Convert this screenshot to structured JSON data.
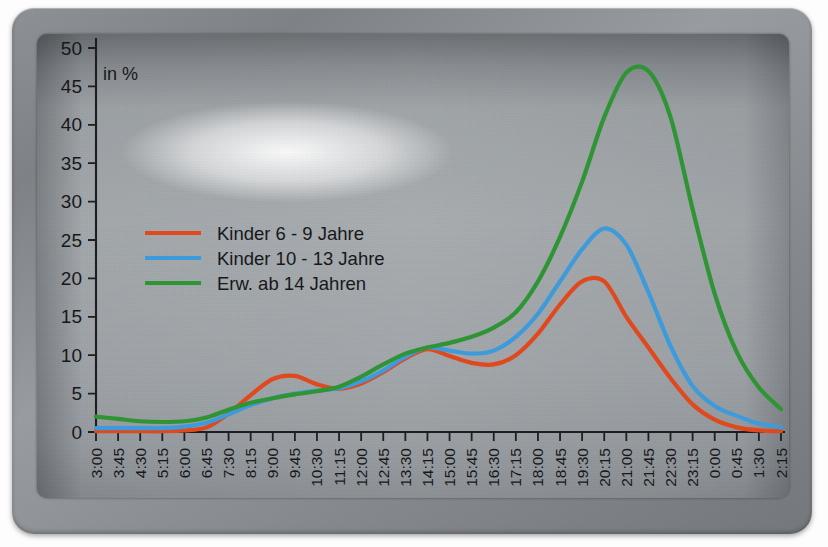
{
  "device": {
    "type": "photographed-display-panel",
    "bezel_color": "#85888c",
    "screen_color": "#cfd2d4"
  },
  "chart_data": {
    "type": "line",
    "title": "",
    "unit_label": "in %",
    "xlabel": "",
    "ylabel": "",
    "ylim": [
      0,
      50
    ],
    "yticks": [
      0,
      5,
      10,
      15,
      20,
      25,
      30,
      35,
      40,
      45,
      50
    ],
    "grid": false,
    "legend_position": "upper-left-inside",
    "x": [
      "3:00",
      "3:45",
      "4:30",
      "5:15",
      "6:00",
      "6:45",
      "7:30",
      "8:15",
      "9:00",
      "9:45",
      "10:30",
      "11:15",
      "12:00",
      "12:45",
      "13:30",
      "14:15",
      "15:00",
      "15:45",
      "16:30",
      "17:15",
      "18:00",
      "18:45",
      "19:30",
      "20:15",
      "21:00",
      "21:45",
      "22:30",
      "23:15",
      "0:00",
      "0:45",
      "1:30",
      "2:15"
    ],
    "series": [
      {
        "name": "Kinder  6 -  9 Jahre",
        "color": "#E0491E",
        "values": [
          0.1,
          0.1,
          0.1,
          0.1,
          0.2,
          0.6,
          2.4,
          4.8,
          6.9,
          7.3,
          6.2,
          5.6,
          6.3,
          7.8,
          9.6,
          10.8,
          9.9,
          9.0,
          8.8,
          10.0,
          12.8,
          16.6,
          19.6,
          19.6,
          15.0,
          11.0,
          7.0,
          3.6,
          1.6,
          0.6,
          0.2,
          0.1
        ]
      },
      {
        "name": "Kinder 10 - 13 Jahre",
        "color": "#3D9BDB",
        "values": [
          0.5,
          0.5,
          0.5,
          0.5,
          0.7,
          1.2,
          2.3,
          3.5,
          4.4,
          5.0,
          5.4,
          5.7,
          6.6,
          8.0,
          9.8,
          11.0,
          10.6,
          10.2,
          10.6,
          12.4,
          15.4,
          19.6,
          23.8,
          26.5,
          24.4,
          18.2,
          11.2,
          6.0,
          3.4,
          2.1,
          1.1,
          0.6
        ]
      },
      {
        "name": "Erw. ab 14 Jahren",
        "color": "#2E9434",
        "values": [
          2.0,
          1.7,
          1.4,
          1.3,
          1.4,
          1.9,
          2.9,
          3.8,
          4.4,
          4.9,
          5.3,
          5.9,
          7.2,
          8.8,
          10.2,
          11.0,
          11.6,
          12.4,
          13.6,
          15.6,
          19.6,
          25.4,
          32.6,
          41.0,
          46.8,
          47.0,
          41.0,
          29.0,
          18.0,
          10.4,
          5.8,
          3.0
        ]
      }
    ]
  },
  "legend": {
    "entries": [
      {
        "label": "Kinder  6 -  9 Jahre",
        "color": "#E0491E"
      },
      {
        "label": "Kinder 10 - 13 Jahre",
        "color": "#3D9BDB"
      },
      {
        "label": "Erw. ab 14 Jahren",
        "color": "#2E9434"
      }
    ]
  }
}
